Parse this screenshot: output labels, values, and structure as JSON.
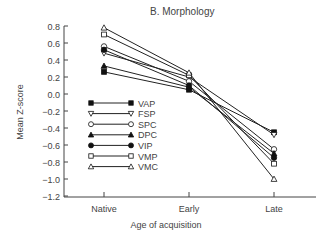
{
  "chart_data": {
    "type": "line",
    "title": "B.  Morphology",
    "xlabel": "Age of acquisition",
    "ylabel": "Mean Z-score",
    "categories": [
      "Native",
      "Early",
      "Late"
    ],
    "ylim": [
      -1.2,
      0.8
    ],
    "yticks": [
      "0.8",
      "0.6",
      "0.4",
      "0.2",
      "0.0",
      "−0.2",
      "−0.4",
      "−0.6",
      "−0.8",
      "−1.0",
      "−1.2"
    ],
    "grid": false,
    "legend_position": "inside-left",
    "series": [
      {
        "name": "VAP",
        "marker": "square-filled",
        "values": [
          0.26,
          0.05,
          -0.45
        ]
      },
      {
        "name": "FSP",
        "marker": "triangle-down-open",
        "values": [
          0.48,
          0.2,
          -0.48
        ]
      },
      {
        "name": "SPC",
        "marker": "circle-open",
        "values": [
          0.56,
          0.15,
          -0.65
        ]
      },
      {
        "name": "DPC",
        "marker": "triangle-up-filled",
        "values": [
          0.33,
          0.08,
          -0.7
        ]
      },
      {
        "name": "VIP",
        "marker": "circle-filled",
        "values": [
          0.52,
          0.1,
          -0.75
        ]
      },
      {
        "name": "VMP",
        "marker": "square-open",
        "values": [
          0.7,
          0.22,
          -0.82
        ]
      },
      {
        "name": "VMC",
        "marker": "triangle-up-open",
        "values": [
          0.78,
          0.25,
          -1.0
        ]
      }
    ]
  }
}
